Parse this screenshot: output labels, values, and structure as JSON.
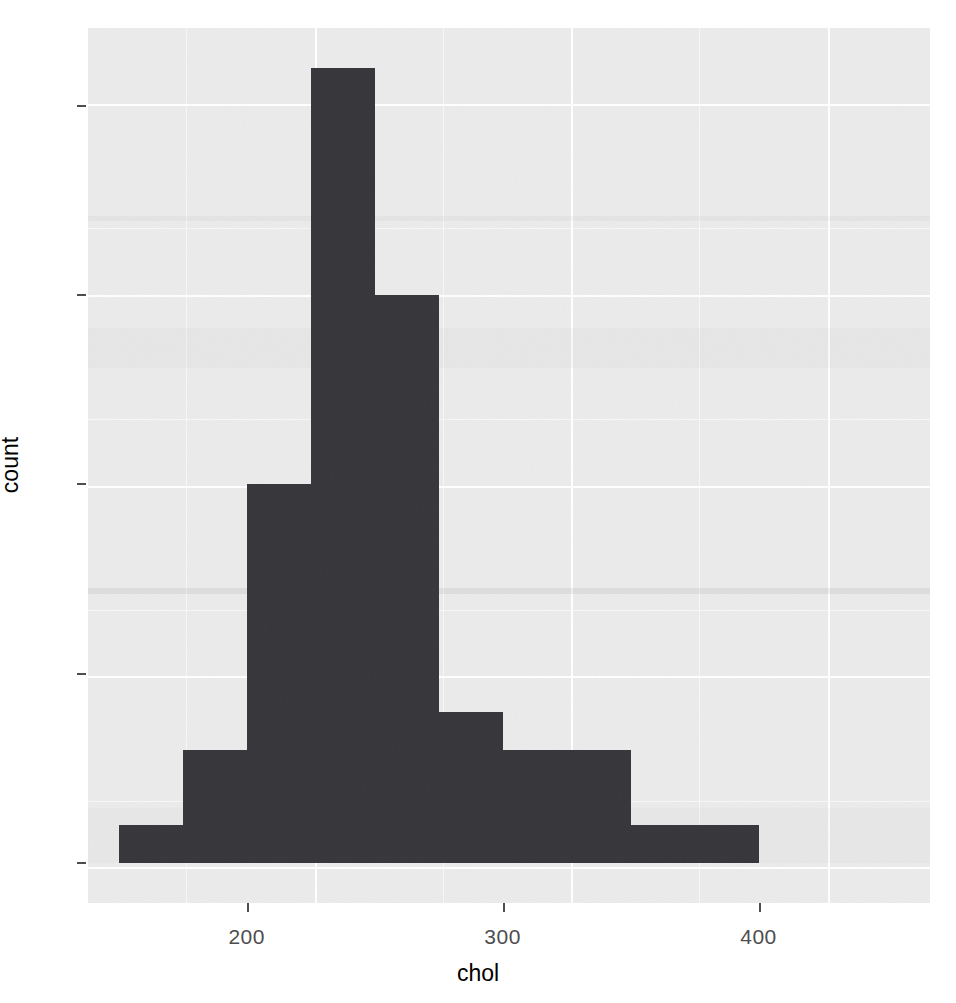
{
  "chart_data": {
    "type": "bar",
    "title": "",
    "subtitle": "",
    "xlabel": "chol",
    "ylabel": "count",
    "xlim": [
      138,
      467
    ],
    "ylim": [
      -1.05,
      22.05
    ],
    "grid": true,
    "legend": false,
    "legend_position": "none",
    "bin_width": 25,
    "bar_color": "#35353a",
    "panel_color": "#ebebeb",
    "gridline_color": "#ffffff",
    "x_tick_labels": [
      "200",
      "300",
      "400"
    ],
    "x_tick_values": [
      200,
      300,
      400
    ],
    "x_minor_ticks": [
      150,
      250,
      350,
      450
    ],
    "y_tick_labels": [
      "0",
      "5",
      "10",
      "15",
      "20"
    ],
    "y_tick_values": [
      0,
      5,
      10,
      15,
      20
    ],
    "y_minor_ticks": [
      2.5,
      7.5,
      12.5,
      17.5
    ],
    "categories": [
      "150-175",
      "175-200",
      "200-225",
      "225-250",
      "250-275",
      "275-300",
      "300-325",
      "325-350",
      "350-375",
      "375-400"
    ],
    "bin_starts": [
      150,
      175,
      200,
      225,
      250,
      275,
      300,
      325,
      350,
      375
    ],
    "bin_ends": [
      175,
      200,
      225,
      250,
      275,
      300,
      325,
      350,
      375,
      400
    ],
    "values": [
      1,
      3,
      10,
      21,
      15,
      4,
      3,
      3,
      1,
      1
    ]
  },
  "axes": {
    "x_title": "chol",
    "y_title": "count"
  }
}
